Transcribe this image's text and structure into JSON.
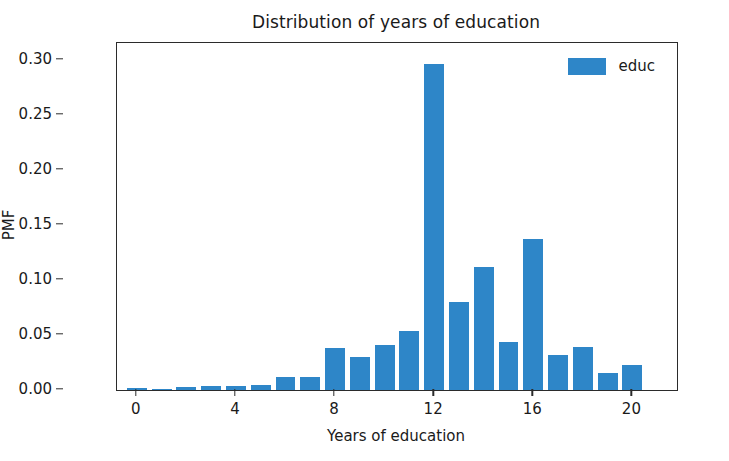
{
  "chart_data": {
    "type": "bar",
    "title": "Distribution of years of education",
    "xlabel": "Years of education",
    "ylabel": "PMF",
    "xlim": [
      -0.8,
      21.8
    ],
    "ylim": [
      0.0,
      0.315
    ],
    "grid": false,
    "bar_color": "#2e86c8",
    "legend": {
      "entries": [
        "educ"
      ],
      "position": "upper right",
      "frame": false
    },
    "categories": [
      0,
      1,
      2,
      3,
      4,
      5,
      6,
      7,
      8,
      9,
      10,
      11,
      12,
      13,
      14,
      15,
      16,
      17,
      18,
      19,
      20,
      21
    ],
    "values": [
      0.002,
      0.0005,
      0.003,
      0.004,
      0.004,
      0.005,
      0.012,
      0.012,
      0.038,
      0.03,
      0.041,
      0.054,
      0.296,
      0.08,
      0.112,
      0.044,
      0.137,
      0.032,
      0.039,
      0.015,
      0.023,
      0.0
    ],
    "series": [
      {
        "name": "educ",
        "values": [
          0.002,
          0.0005,
          0.003,
          0.004,
          0.004,
          0.005,
          0.012,
          0.012,
          0.038,
          0.03,
          0.041,
          0.054,
          0.296,
          0.08,
          0.112,
          0.044,
          0.137,
          0.032,
          0.039,
          0.015,
          0.023,
          0.0
        ]
      }
    ],
    "xticks": [
      0,
      4,
      8,
      12,
      16,
      20
    ],
    "xtick_labels": [
      "0",
      "4",
      "8",
      "12",
      "16",
      "20"
    ],
    "yticks": [
      0.0,
      0.05,
      0.1,
      0.15,
      0.2,
      0.25,
      0.3
    ],
    "ytick_labels": [
      "0.00",
      "0.05",
      "0.10",
      "0.15",
      "0.20",
      "0.25",
      "0.30"
    ]
  }
}
